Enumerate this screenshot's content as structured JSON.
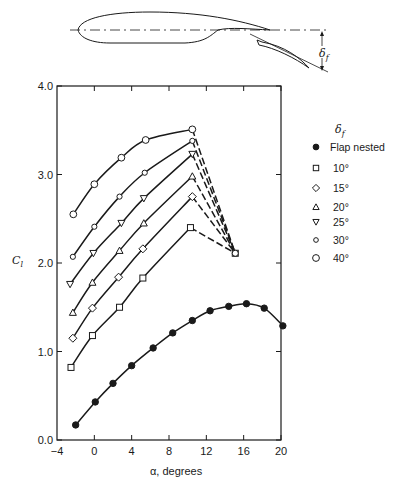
{
  "figure": {
    "diagram": {
      "description": "Airfoil with deflected trailing-edge flap",
      "deflection_symbol": "δ",
      "deflection_subscript": "f"
    },
    "legend": {
      "title_symbol": "δ",
      "title_subscript": "f",
      "items": [
        {
          "label": "Flap nested",
          "marker": "filled-circle"
        },
        {
          "label": "10°",
          "marker": "square"
        },
        {
          "label": "15°",
          "marker": "diamond"
        },
        {
          "label": "20°",
          "marker": "triangle-up"
        },
        {
          "label": "25°",
          "marker": "triangle-down"
        },
        {
          "label": "30°",
          "marker": "small-circle"
        },
        {
          "label": "40°",
          "marker": "circle"
        }
      ]
    }
  },
  "chart_data": {
    "type": "line",
    "title": "",
    "xlabel": "α, degrees",
    "ylabel_symbol": "C",
    "ylabel_subscript": "l",
    "xlim": [
      -4,
      20
    ],
    "ylim": [
      0.0,
      4.0
    ],
    "xticks": [
      -4,
      0,
      4,
      8,
      12,
      16,
      20
    ],
    "xtick_labels": [
      "−4",
      "0",
      "4",
      "8",
      "12",
      "16",
      "20"
    ],
    "yticks": [
      0.0,
      1.0,
      2.0,
      3.0,
      4.0
    ],
    "ytick_labels": [
      "0.0",
      "1.0",
      "2.0",
      "3.0",
      "4.0"
    ],
    "grid": false,
    "legend_position": "right, outside plot",
    "convergence_point": {
      "x": 15.1,
      "y": 2.11
    },
    "series": [
      {
        "name": "Flap nested",
        "marker": "filled-circle",
        "x": [
          -2.0,
          0.1,
          2.0,
          4.0,
          6.3,
          8.4,
          10.5,
          12.4,
          14.4,
          16.3,
          18.2,
          20.2
        ],
        "y": [
          0.17,
          0.43,
          0.64,
          0.84,
          1.04,
          1.21,
          1.35,
          1.46,
          1.51,
          1.54,
          1.49,
          1.29
        ],
        "dashed_to_convergence": false
      },
      {
        "name": "10°",
        "marker": "square",
        "x": [
          -2.5,
          -0.2,
          2.7,
          5.2,
          10.3
        ],
        "y": [
          0.82,
          1.18,
          1.5,
          1.83,
          2.4
        ],
        "dashed_to_convergence": true
      },
      {
        "name": "15°",
        "marker": "diamond",
        "x": [
          -2.3,
          -0.2,
          2.6,
          5.2,
          10.5
        ],
        "y": [
          1.15,
          1.49,
          1.84,
          2.16,
          2.75
        ],
        "dashed_to_convergence": true
      },
      {
        "name": "20°",
        "marker": "triangle-up",
        "x": [
          -2.3,
          -0.2,
          2.7,
          5.3,
          10.5
        ],
        "y": [
          1.44,
          1.78,
          2.14,
          2.45,
          2.98
        ],
        "dashed_to_convergence": true
      },
      {
        "name": "25°",
        "marker": "triangle-down",
        "x": [
          -2.6,
          -0.1,
          2.9,
          5.3,
          10.5
        ],
        "y": [
          1.76,
          2.11,
          2.45,
          2.73,
          3.23
        ],
        "dashed_to_convergence": true
      },
      {
        "name": "30°",
        "marker": "small-circle",
        "x": [
          -2.3,
          0.0,
          2.7,
          5.4,
          10.5
        ],
        "y": [
          2.07,
          2.41,
          2.75,
          3.02,
          3.38
        ],
        "dashed_to_convergence": true
      },
      {
        "name": "40°",
        "marker": "circle",
        "x": [
          -2.25,
          0.0,
          2.9,
          5.5,
          10.5
        ],
        "y": [
          2.55,
          2.89,
          3.19,
          3.39,
          3.51
        ],
        "dashed_to_convergence": true
      }
    ]
  }
}
